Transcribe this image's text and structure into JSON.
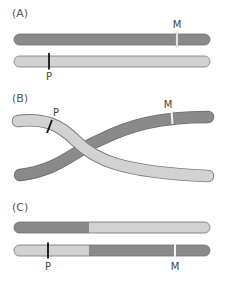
{
  "figure": {
    "colors": {
      "dark_chromosome": "#8a8a8a",
      "light_chromosome": "#d2d2d2",
      "outline": "#6e6e6e",
      "marker_P": "#111111",
      "marker_M": "#f4f4f4",
      "text": "#444444"
    },
    "panels": [
      {
        "label": "(A)",
        "description": "Two homologous chromosomes before crossing over",
        "chromosomes": [
          {
            "shade": "dark",
            "markers": [
              {
                "name": "M",
                "label": "M"
              }
            ]
          },
          {
            "shade": "light",
            "markers": [
              {
                "name": "P",
                "label": "P"
              }
            ]
          }
        ]
      },
      {
        "label": "(B)",
        "description": "Chromosomes crossing over (chiasma)",
        "chromosomes": [
          {
            "shade": "light",
            "markers": [
              {
                "name": "P",
                "label": "P"
              }
            ]
          },
          {
            "shade": "dark",
            "markers": [
              {
                "name": "M",
                "label": "M"
              }
            ]
          }
        ]
      },
      {
        "label": "(C)",
        "description": "Recombinant chromosomes after crossing over",
        "chromosomes": [
          {
            "shade": "dark-left / light-right",
            "markers": []
          },
          {
            "shade": "light-left / dark-right",
            "markers": [
              {
                "name": "P",
                "label": "P"
              },
              {
                "name": "M",
                "label": "M"
              }
            ]
          }
        ]
      }
    ]
  }
}
